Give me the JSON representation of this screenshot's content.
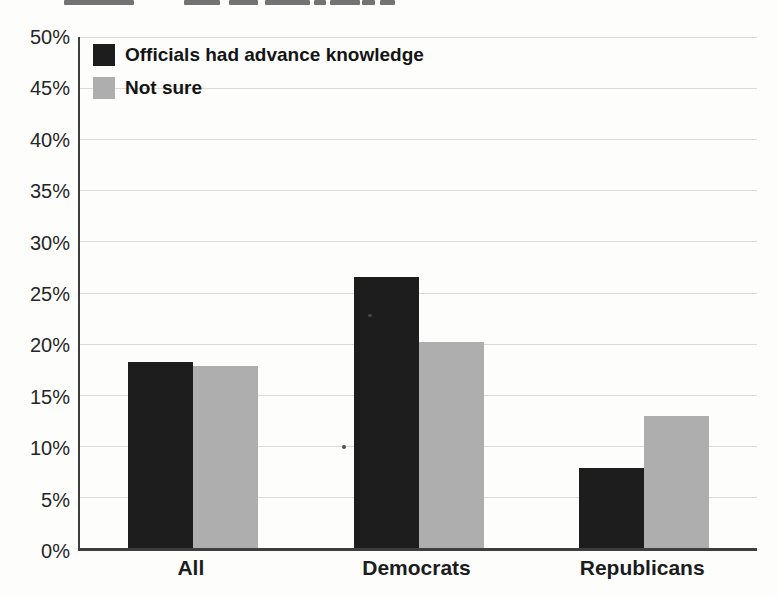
{
  "chart_data": {
    "type": "bar",
    "title": "",
    "categories": [
      "All",
      "Democrats",
      "Republicans"
    ],
    "series": [
      {
        "name": "Officials had advance knowledge",
        "color": "#1d1d1d",
        "values": [
          18.2,
          26.5,
          7.8
        ]
      },
      {
        "name": "Not sure",
        "color": "#aeaeae",
        "values": [
          17.8,
          20.2,
          12.9
        ]
      }
    ],
    "xlabel": "",
    "ylabel": "",
    "ylim": [
      0,
      50
    ],
    "ytick_step": 5,
    "ytick_labels": [
      "0%",
      "5%",
      "10%",
      "15%",
      "20%",
      "25%",
      "30%",
      "35%",
      "40%",
      "45%",
      "50%"
    ],
    "grid": true,
    "legend_position": "top-left",
    "colors": {
      "gridline": "#dadada",
      "axis": "#3e3e3e",
      "tick_text": "#262626",
      "background": "#fdfdfc"
    }
  }
}
